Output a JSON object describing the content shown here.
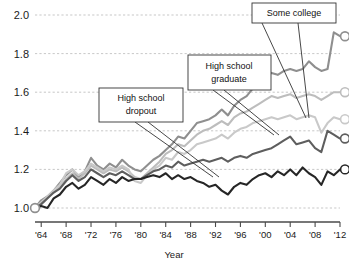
{
  "chart_data": {
    "type": "line",
    "title": "",
    "xlabel": "Year",
    "ylabel": "",
    "xlim": [
      1963,
      2012
    ],
    "ylim": [
      1.0,
      2.0
    ],
    "grid": true,
    "legend_position": "annotations-inline",
    "xticks": [
      1964,
      1968,
      1972,
      1976,
      1980,
      1984,
      1988,
      1992,
      1996,
      2000,
      2004,
      2008,
      2012
    ],
    "xtick_labels": [
      "'64",
      "'68",
      "'72",
      "'76",
      "'80",
      "'84",
      "'88",
      "'92",
      "'96",
      "'00",
      "'04",
      "'08",
      "'12"
    ],
    "yticks": [
      1.0,
      1.2,
      1.4,
      1.6,
      1.8,
      2.0
    ],
    "ytick_labels": [
      "1.0",
      "1.2",
      "1.4",
      "1.6",
      "1.8",
      "2.0"
    ],
    "x": [
      1963,
      1964,
      1965,
      1966,
      1967,
      1968,
      1969,
      1970,
      1971,
      1972,
      1973,
      1974,
      1975,
      1976,
      1977,
      1978,
      1979,
      1980,
      1981,
      1982,
      1983,
      1984,
      1985,
      1986,
      1987,
      1988,
      1989,
      1990,
      1991,
      1992,
      1993,
      1994,
      1995,
      1996,
      1997,
      1998,
      1999,
      2000,
      2001,
      2002,
      2003,
      2004,
      2005,
      2006,
      2007,
      2008,
      2009,
      2010,
      2011,
      2012
    ],
    "series": [
      {
        "name": "Post-graduate degree",
        "color": "#8f8f8f",
        "values": [
          1.0,
          1.04,
          1.06,
          1.09,
          1.13,
          1.17,
          1.2,
          1.16,
          1.19,
          1.26,
          1.22,
          1.2,
          1.23,
          1.21,
          1.25,
          1.22,
          1.2,
          1.19,
          1.22,
          1.25,
          1.27,
          1.3,
          1.33,
          1.37,
          1.36,
          1.4,
          1.44,
          1.45,
          1.46,
          1.48,
          1.51,
          1.48,
          1.53,
          1.56,
          1.58,
          1.62,
          1.66,
          1.68,
          1.7,
          1.69,
          1.71,
          1.72,
          1.71,
          1.72,
          1.76,
          1.73,
          1.71,
          1.72,
          1.91,
          1.89
        ]
      },
      {
        "name": "College graduate",
        "color": "#bdbdbd",
        "values": [
          1.0,
          1.02,
          1.05,
          1.08,
          1.11,
          1.15,
          1.18,
          1.15,
          1.18,
          1.22,
          1.2,
          1.18,
          1.2,
          1.19,
          1.21,
          1.19,
          1.16,
          1.15,
          1.18,
          1.21,
          1.24,
          1.28,
          1.3,
          1.33,
          1.32,
          1.35,
          1.38,
          1.4,
          1.41,
          1.43,
          1.45,
          1.43,
          1.47,
          1.49,
          1.5,
          1.52,
          1.54,
          1.56,
          1.58,
          1.57,
          1.58,
          1.59,
          1.57,
          1.58,
          1.59,
          1.58,
          1.56,
          1.58,
          1.6,
          1.6
        ]
      },
      {
        "name": "Some college",
        "color": "#c9c9c9",
        "values": [
          1.0,
          1.03,
          1.06,
          1.09,
          1.12,
          1.18,
          1.2,
          1.17,
          1.19,
          1.23,
          1.21,
          1.19,
          1.21,
          1.2,
          1.22,
          1.2,
          1.14,
          1.13,
          1.17,
          1.2,
          1.22,
          1.26,
          1.25,
          1.29,
          1.28,
          1.3,
          1.33,
          1.34,
          1.35,
          1.36,
          1.38,
          1.36,
          1.39,
          1.41,
          1.42,
          1.44,
          1.45,
          1.46,
          1.47,
          1.46,
          1.47,
          1.48,
          1.46,
          1.47,
          1.48,
          1.47,
          1.39,
          1.44,
          1.47,
          1.46
        ]
      },
      {
        "name": "High school graduate",
        "color": "#5e5e5e",
        "values": [
          1.0,
          1.02,
          1.05,
          1.08,
          1.1,
          1.14,
          1.17,
          1.14,
          1.16,
          1.2,
          1.18,
          1.16,
          1.18,
          1.17,
          1.19,
          1.17,
          1.15,
          1.15,
          1.17,
          1.19,
          1.2,
          1.22,
          1.21,
          1.24,
          1.22,
          1.23,
          1.24,
          1.25,
          1.24,
          1.25,
          1.26,
          1.24,
          1.26,
          1.27,
          1.26,
          1.28,
          1.29,
          1.3,
          1.31,
          1.33,
          1.35,
          1.37,
          1.33,
          1.34,
          1.35,
          1.31,
          1.29,
          1.4,
          1.38,
          1.36
        ]
      },
      {
        "name": "High school dropout",
        "color": "#262626",
        "values": [
          1.0,
          1.01,
          1.0,
          1.05,
          1.07,
          1.11,
          1.13,
          1.1,
          1.12,
          1.16,
          1.14,
          1.12,
          1.15,
          1.13,
          1.16,
          1.14,
          1.15,
          1.15,
          1.16,
          1.17,
          1.16,
          1.18,
          1.15,
          1.17,
          1.15,
          1.16,
          1.14,
          1.13,
          1.11,
          1.12,
          1.09,
          1.07,
          1.11,
          1.13,
          1.12,
          1.15,
          1.17,
          1.18,
          1.16,
          1.19,
          1.17,
          1.2,
          1.17,
          1.21,
          1.18,
          1.16,
          1.12,
          1.19,
          1.17,
          1.2
        ]
      }
    ],
    "annotations": [
      {
        "id": "high-school-dropout",
        "label_line1": "High school",
        "label_line2": "dropout"
      },
      {
        "id": "high-school-graduate",
        "label_line1": "High school",
        "label_line2": "graduate"
      },
      {
        "id": "some-college",
        "label_line1": "Some college",
        "label_line2": ""
      }
    ]
  }
}
